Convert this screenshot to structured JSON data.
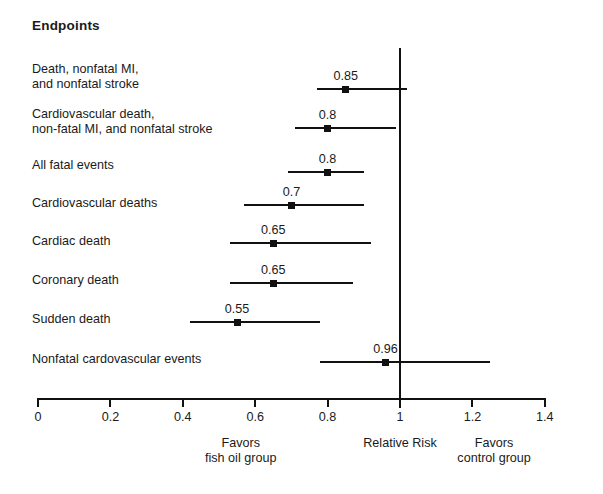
{
  "figure": {
    "title": "Endpoints",
    "width": 603,
    "height": 494
  },
  "chart_data": {
    "type": "forest",
    "title": "Endpoints",
    "xlabel": "Relative Risk",
    "ylabel": "",
    "xlim": [
      0,
      1.4
    ],
    "xticks": [
      0,
      0.2,
      0.4,
      0.6,
      0.8,
      1,
      1.2,
      1.4
    ],
    "xtick_labels": [
      "0",
      "0.2",
      "0.4",
      "0.6",
      "0.8",
      "1",
      "1.2",
      "1.4"
    ],
    "grid": false,
    "null_line": 1,
    "legend": "none",
    "left_caption_line1": "Favors",
    "left_caption_line2": "fish oil group",
    "center_caption": "Relative Risk",
    "right_caption_line1": "Favors",
    "right_caption_line2": "control group",
    "color": "#111111",
    "rows": [
      {
        "label_line1": "Death, nonfatal MI,",
        "label_line2": "and nonfatal stroke",
        "estimate": 0.85,
        "estimate_label": "0.85",
        "ci_low": 0.77,
        "ci_high": 1.02
      },
      {
        "label_line1": "Cardiovascular death,",
        "label_line2": "non-fatal MI, and nonfatal stroke",
        "estimate": 0.8,
        "estimate_label": "0.8",
        "ci_low": 0.71,
        "ci_high": 0.99
      },
      {
        "label_line1": "All fatal events",
        "label_line2": "",
        "estimate": 0.8,
        "estimate_label": "0.8",
        "ci_low": 0.69,
        "ci_high": 0.9
      },
      {
        "label_line1": "Cardiovascular deaths",
        "label_line2": "",
        "estimate": 0.7,
        "estimate_label": "0.7",
        "ci_low": 0.57,
        "ci_high": 0.9
      },
      {
        "label_line1": "Cardiac death",
        "label_line2": "",
        "estimate": 0.65,
        "estimate_label": "0.65",
        "ci_low": 0.53,
        "ci_high": 0.92
      },
      {
        "label_line1": "Coronary death",
        "label_line2": "",
        "estimate": 0.65,
        "estimate_label": "0.65",
        "ci_low": 0.53,
        "ci_high": 0.87
      },
      {
        "label_line1": "Sudden death",
        "label_line2": "",
        "estimate": 0.55,
        "estimate_label": "0.55",
        "ci_low": 0.42,
        "ci_high": 0.78
      },
      {
        "label_line1": "Nonfatal cardovascular events",
        "label_line2": "",
        "estimate": 0.96,
        "estimate_label": "0.96",
        "ci_low": 0.78,
        "ci_high": 1.25
      }
    ]
  },
  "layout": {
    "axis_x0_px": 38,
    "axis_x_per_unit_px": 362,
    "axis_y_px": 398,
    "axis_tick_height_px": 9,
    "null_line_top_px": 48,
    "null_line_bottom_px": 408,
    "row_line_y_px": [
      89,
      128,
      172,
      205,
      243,
      283,
      322,
      362
    ],
    "row_label_top_px": [
      62,
      107,
      158,
      196,
      234,
      273,
      312,
      352
    ]
  }
}
